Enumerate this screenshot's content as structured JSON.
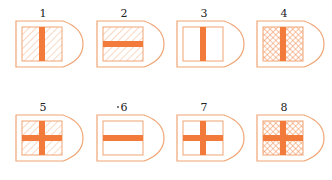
{
  "colors": {
    "stroke": "#f0a575",
    "stroke_light": "#f5c4a3",
    "bar": "#f27a3a",
    "hatch": "#f3b38a",
    "background": "#ffffff"
  },
  "items": [
    {
      "label": "1",
      "fill": "diagonal-hatch",
      "bar": "vertical"
    },
    {
      "label": "2",
      "fill": "diagonal-hatch",
      "bar": "horizontal"
    },
    {
      "label": "3",
      "fill": "none",
      "bar": "vertical"
    },
    {
      "label": "4",
      "fill": "cross-hatch",
      "bar": "vertical"
    },
    {
      "label": "5",
      "fill": "diagonal-hatch",
      "bar": "cross"
    },
    {
      "label": "6",
      "fill": "none",
      "bar": "horizontal"
    },
    {
      "label": "7",
      "fill": "none",
      "bar": "cross"
    },
    {
      "label": "8",
      "fill": "cross-hatch",
      "bar": "cross"
    }
  ]
}
